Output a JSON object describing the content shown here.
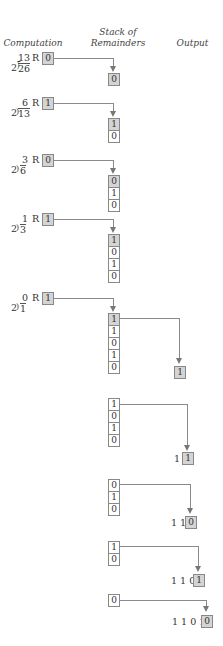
{
  "headers": {
    "computation": "Computation",
    "stack_line1": "Stack of",
    "stack_line2": "Remainders",
    "output": "Output"
  },
  "remainder_label": "R",
  "divisor": "2",
  "steps": [
    {
      "quotient": "13",
      "dividend": "26",
      "remainder": "0",
      "stack": [
        "0"
      ]
    },
    {
      "quotient": "6",
      "dividend": "13",
      "remainder": "1",
      "stack": [
        "1",
        "0"
      ]
    },
    {
      "quotient": "3",
      "dividend": "6",
      "remainder": "0",
      "stack": [
        "0",
        "1",
        "0"
      ]
    },
    {
      "quotient": "1",
      "dividend": "3",
      "remainder": "1",
      "stack": [
        "1",
        "0",
        "1",
        "0"
      ]
    },
    {
      "quotient": "0",
      "dividend": "1",
      "remainder": "1",
      "stack": [
        "1",
        "1",
        "0",
        "1",
        "0"
      ]
    }
  ],
  "pops": [
    {
      "stack": [
        "1",
        "1",
        "0",
        "1",
        "0"
      ],
      "output_prefix": "",
      "output_new": "1"
    },
    {
      "stack": [
        "1",
        "0",
        "1",
        "0"
      ],
      "output_prefix": "1",
      "output_new": "1"
    },
    {
      "stack": [
        "0",
        "1",
        "0"
      ],
      "output_prefix": "1 1",
      "output_new": "0"
    },
    {
      "stack": [
        "1",
        "0"
      ],
      "output_prefix": "1 1 0",
      "output_new": "1"
    },
    {
      "stack": [
        "0"
      ],
      "output_prefix": "1 1 0 1",
      "output_new": "0"
    }
  ],
  "colors": {
    "highlight_box": "#d4d4d4",
    "line": "#8a8a8a"
  }
}
